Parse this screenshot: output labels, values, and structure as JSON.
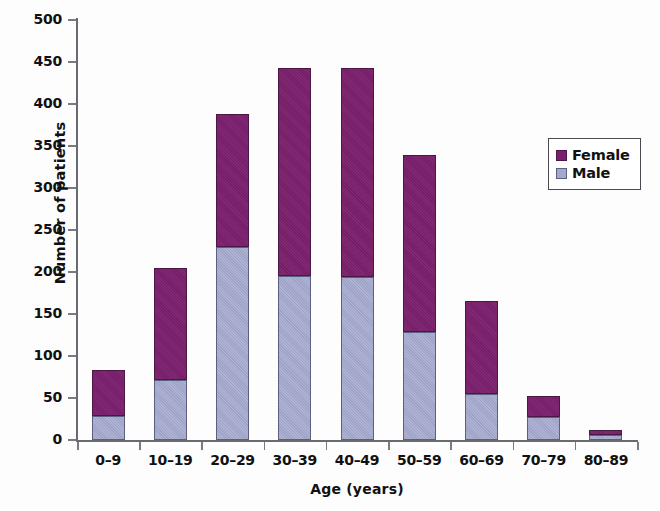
{
  "chart_data": {
    "type": "bar",
    "subtype": "stacked-vertical",
    "title": "",
    "xlabel": "Age (years)",
    "ylabel": "Number of patients",
    "categories": [
      "0–9",
      "10–19",
      "20–29",
      "30–39",
      "40–49",
      "50–59",
      "60–69",
      "70–79",
      "80–89"
    ],
    "series": [
      {
        "name": "Male",
        "color": "#a3a8cd",
        "values": [
          29,
          72,
          230,
          195,
          194,
          128,
          55,
          27,
          6
        ]
      },
      {
        "name": "Female",
        "color": "#7c1f6e",
        "values": [
          54,
          133,
          158,
          248,
          249,
          211,
          110,
          25,
          6
        ]
      }
    ],
    "totals": [
      83,
      205,
      388,
      443,
      443,
      339,
      165,
      52,
      12
    ],
    "ylim": [
      0,
      500
    ],
    "yticks": [
      0,
      50,
      100,
      150,
      200,
      250,
      300,
      350,
      400,
      450,
      500
    ],
    "ytick_labels": [
      "0",
      "50",
      "100",
      "150",
      "200",
      "250",
      "300",
      "350",
      "400",
      "450",
      "500"
    ],
    "grid": false,
    "legend_position": "right",
    "stack_order_bottom_to_top": [
      "Male",
      "Female"
    ]
  },
  "legend": {
    "entries": [
      {
        "label": "Female",
        "swatch": "female-swatch"
      },
      {
        "label": "Male",
        "swatch": "male-swatch"
      }
    ]
  },
  "axes": {
    "y_title": "Number of patients",
    "x_title": "Age (years)"
  }
}
